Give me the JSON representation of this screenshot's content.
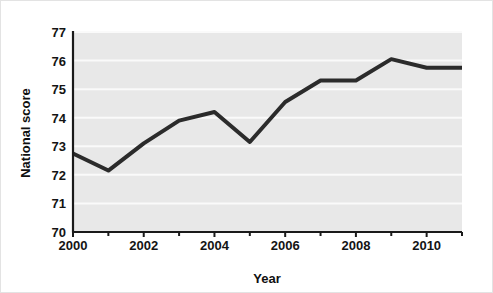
{
  "chart_data": {
    "type": "line",
    "title": "",
    "subtitle": "",
    "xlabel": "Year",
    "ylabel": "National score",
    "x": [
      2000,
      2001,
      2002,
      2003,
      2004,
      2005,
      2006,
      2007,
      2008,
      2009,
      2010,
      2011
    ],
    "values": [
      72.75,
      72.15,
      73.1,
      73.9,
      74.2,
      73.15,
      74.55,
      75.3,
      75.3,
      76.05,
      75.75,
      75.75
    ],
    "series": [
      {
        "name": "National score",
        "values": [
          72.75,
          72.15,
          73.1,
          73.9,
          74.2,
          73.15,
          74.55,
          75.3,
          75.3,
          76.05,
          75.75,
          75.75
        ]
      }
    ],
    "xlim": [
      2000,
      2011
    ],
    "ylim": [
      70,
      77
    ],
    "y_ticks": [
      70,
      71,
      72,
      73,
      74,
      75,
      76,
      77
    ],
    "y_tick_labels": [
      "70",
      "71",
      "72",
      "73",
      "74",
      "75",
      "76",
      "77"
    ],
    "x_ticks": [
      2000,
      2001,
      2002,
      2003,
      2004,
      2005,
      2006,
      2007,
      2008,
      2009,
      2010,
      2011
    ],
    "x_tick_labels_major": [
      "2000",
      "2002",
      "2004",
      "2006",
      "2008",
      "2010"
    ],
    "x_major_ticks": [
      2000,
      2002,
      2004,
      2006,
      2008,
      2010
    ],
    "grid": "horizontal",
    "legend": "none",
    "annotations": [],
    "colors": {
      "plot_background": "#e8e8e8",
      "figure_background": "#ffffff",
      "gridline": "#fafafa",
      "line": "#2b2b2b",
      "axis": "#1a1a1a",
      "text": "#141414"
    },
    "line_width": 4
  },
  "axes": {
    "y_title": "National score",
    "x_title": "Year"
  }
}
